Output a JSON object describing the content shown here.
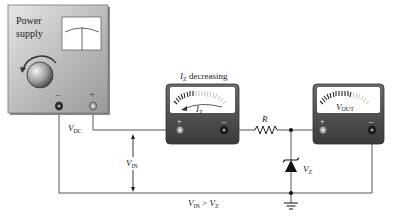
{
  "power_supply": {
    "label_line1": "Power",
    "label_line2": "supply",
    "minus": "–",
    "plus": "+"
  },
  "ammeter": {
    "caption_main": "I",
    "caption_sub": "Z",
    "caption_rest": " decreasing",
    "face_main": "I",
    "face_sub": "Z",
    "plus": "+",
    "minus": "–"
  },
  "voltmeter": {
    "face_main": "V",
    "face_sub": "OUT",
    "plus": "+",
    "minus": "–"
  },
  "labels": {
    "vdc_main": "V",
    "vdc_sub": "DC",
    "vin_main": "V",
    "vin_sub": "IN",
    "r": "R",
    "vz_main": "V",
    "vz_sub": "Z",
    "cond_v1": "V",
    "cond_s1": "IN",
    "cond_gt": " > ",
    "cond_v2": "V",
    "cond_s2": "Z"
  },
  "colors": {
    "wire": "#555555",
    "instrument_dark": "#4a4a4a",
    "panel_light": "#c8c8c8"
  }
}
